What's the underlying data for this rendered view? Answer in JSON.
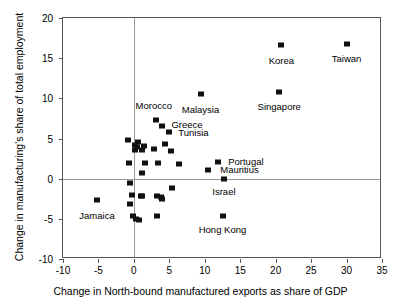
{
  "chart_data": {
    "type": "scatter",
    "title": "",
    "xlabel": "Change in North-bound manufactured exports as share of GDP",
    "ylabel": "Change in manufacturing's share of total employment",
    "xlim": [
      -10,
      35
    ],
    "ylim": [
      -10,
      20
    ],
    "xticks": [
      -10,
      -5,
      0,
      5,
      10,
      15,
      20,
      25,
      30,
      35
    ],
    "yticks": [
      -10,
      -5,
      0,
      5,
      10,
      15,
      20
    ],
    "grid": false,
    "legend": null,
    "zero_lines": {
      "x": 0,
      "y": 0,
      "color": "#9a9a9a"
    },
    "marker": {
      "shape": "square",
      "color": "#111111",
      "size": 6
    },
    "labeled_points": [
      {
        "name": "Taiwan",
        "x": 30.0,
        "y": 16.8,
        "label_dx": 0,
        "label_dy": -1.9
      },
      {
        "name": "Korea",
        "x": 20.8,
        "y": 16.6,
        "label_dx": 0,
        "label_dy": -1.9
      },
      {
        "name": "Singapore",
        "x": 20.5,
        "y": 10.8,
        "label_dx": 0,
        "label_dy": -1.9
      },
      {
        "name": "Malaysia",
        "x": 9.4,
        "y": 10.5,
        "label_dx": 0,
        "label_dy": -1.9
      },
      {
        "name": "Morocco",
        "x": 3.1,
        "y": 7.3,
        "label_dx": -0.3,
        "label_dy": 1.7
      },
      {
        "name": "Greece",
        "x": 3.9,
        "y": 6.6,
        "label_dx": 3.6,
        "label_dy": 0.1
      },
      {
        "name": "Tunisia",
        "x": 5.0,
        "y": 5.8,
        "label_dx": 3.4,
        "label_dy": -0.1
      },
      {
        "name": "Portugal",
        "x": 11.8,
        "y": 2.1,
        "label_dx": 4.0,
        "label_dy": 0.0
      },
      {
        "name": "Mauritius",
        "x": 10.5,
        "y": 1.1,
        "label_dx": 4.4,
        "label_dy": 0.0
      },
      {
        "name": "Israel",
        "x": 12.7,
        "y": 0.0,
        "label_dx": 0,
        "label_dy": -1.6
      },
      {
        "name": "Hong Kong",
        "x": 12.5,
        "y": -4.6,
        "label_dx": 0,
        "label_dy": -1.8
      },
      {
        "name": "Jamaica",
        "x": -5.2,
        "y": -2.7,
        "label_dx": 0,
        "label_dy": -1.9
      }
    ],
    "unlabeled_points": [
      {
        "x": -0.9,
        "y": 4.8
      },
      {
        "x": 0.6,
        "y": 4.6
      },
      {
        "x": 0.4,
        "y": 3.9
      },
      {
        "x": 0.1,
        "y": 3.6
      },
      {
        "x": 0.2,
        "y": 4.2
      },
      {
        "x": 1.4,
        "y": 4.1
      },
      {
        "x": 1.2,
        "y": 3.6
      },
      {
        "x": 2.8,
        "y": 3.7
      },
      {
        "x": 4.4,
        "y": 4.3
      },
      {
        "x": 5.3,
        "y": 3.4
      },
      {
        "x": -0.7,
        "y": 1.9
      },
      {
        "x": 1.6,
        "y": 1.9
      },
      {
        "x": 3.4,
        "y": 1.9
      },
      {
        "x": 6.4,
        "y": 1.8
      },
      {
        "x": 1.2,
        "y": 0.7
      },
      {
        "x": -0.6,
        "y": -0.5
      },
      {
        "x": 5.4,
        "y": -1.1
      },
      {
        "x": -0.3,
        "y": -2.0
      },
      {
        "x": 1.0,
        "y": -2.1
      },
      {
        "x": 1.2,
        "y": -2.2
      },
      {
        "x": 3.2,
        "y": -2.1
      },
      {
        "x": 3.8,
        "y": -2.3
      },
      {
        "x": 4.0,
        "y": -2.5
      },
      {
        "x": -0.6,
        "y": -3.1
      },
      {
        "x": 3.2,
        "y": -4.6
      },
      {
        "x": -0.1,
        "y": -4.6
      },
      {
        "x": 0.3,
        "y": -5.0
      },
      {
        "x": 0.7,
        "y": -5.1
      }
    ]
  }
}
